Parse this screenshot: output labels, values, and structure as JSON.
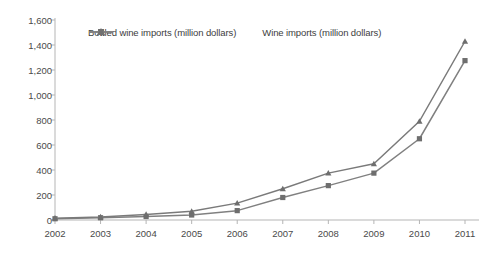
{
  "chart_data": {
    "type": "line",
    "title": "",
    "subtitle": "",
    "xlabel": "",
    "ylabel": "",
    "categories": [
      "2002",
      "2003",
      "2004",
      "2005",
      "2006",
      "2007",
      "2008",
      "2009",
      "2010",
      "2011"
    ],
    "x": [
      2002,
      2003,
      2004,
      2005,
      2006,
      2007,
      2008,
      2009,
      2010,
      2011
    ],
    "xlim": [
      2002,
      2011
    ],
    "ylim": [
      0,
      1600
    ],
    "ytick_labels": [
      "0",
      "200",
      "400",
      "600",
      "800",
      "1,000",
      "1,200",
      "1,400",
      "1,600"
    ],
    "yticks": [
      0,
      200,
      400,
      600,
      800,
      1000,
      1200,
      1400,
      1600
    ],
    "grid": false,
    "legend_position": "top-center",
    "series": [
      {
        "name": "Bottled wine imports (million dollars)",
        "marker": "square",
        "color": "#808080",
        "values": [
          10,
          18,
          28,
          40,
          75,
          180,
          275,
          375,
          650,
          1275
        ]
      },
      {
        "name": "Wine imports (million dollars)",
        "marker": "triangle",
        "color": "#7a7a7a",
        "values": [
          15,
          25,
          45,
          70,
          135,
          250,
          375,
          450,
          790,
          1430
        ]
      }
    ]
  },
  "legend": {
    "entries": [
      {
        "label": "Bottled wine imports (million dollars)",
        "marker": "square-marker-icon"
      },
      {
        "label": "Wine imports (million dollars)",
        "marker": "triangle-marker-icon"
      }
    ]
  },
  "colors": {
    "line": "#808080",
    "axis": "#b5b5b5",
    "text": "#4a4a4a",
    "background": "#ffffff"
  }
}
